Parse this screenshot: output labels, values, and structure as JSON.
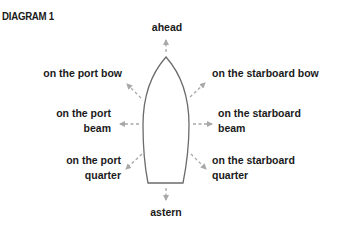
{
  "title": "DIAGRAM 1",
  "colors": {
    "text": "#1a1a1a",
    "hull_outline": "#6b6b6b",
    "arrow": "#a8a8a8",
    "background": "#ffffff"
  },
  "labels": {
    "ahead": "ahead",
    "astern": "astern",
    "port_bow": "on the port bow",
    "port_beam": {
      "line1": "on the port",
      "line2": "beam"
    },
    "port_quarter": {
      "line1": "on the port",
      "line2": "quarter"
    },
    "starboard_bow": "on the starboard bow",
    "starboard_beam": {
      "line1": "on the starboard",
      "line2": "beam"
    },
    "starboard_quarter": {
      "line1": "on the starboard",
      "line2": "quarter"
    }
  },
  "icons": {
    "hull": "boat-hull-icon",
    "arrow": "dashed-arrow-icon"
  }
}
